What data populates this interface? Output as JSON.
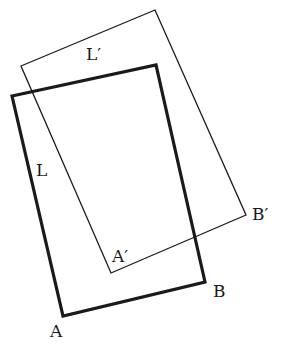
{
  "diagram": {
    "colors": {
      "stroke": "#1a1a1a",
      "background": "#ffffff"
    },
    "shapes": {
      "original": {
        "name": "L",
        "points": "12,96 156,65 205,282 63,316",
        "stroke_width": 3.2
      },
      "transformed": {
        "name": "L'",
        "points": "21,66 155,10 246,215 111,273",
        "stroke_width": 1.3
      }
    },
    "labels": {
      "L": {
        "text": "L",
        "x": 36,
        "y": 176
      },
      "L_prime": {
        "text": "L′",
        "x": 86,
        "y": 60
      },
      "A": {
        "text": "A",
        "x": 50,
        "y": 337
      },
      "B": {
        "text": "B",
        "x": 213,
        "y": 297
      },
      "A_prime": {
        "text": "A′",
        "x": 112,
        "y": 262
      },
      "B_prime": {
        "text": "B′",
        "x": 252,
        "y": 220
      }
    }
  }
}
